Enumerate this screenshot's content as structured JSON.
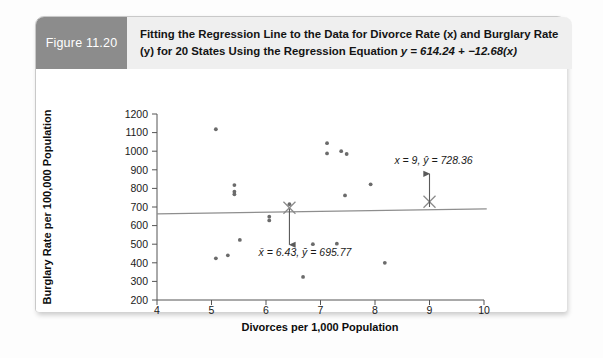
{
  "figure": {
    "badge_label": "Figure 11.20",
    "caption_line1": "Fitting the Regression Line to the Data for Divorce Rate (x) and Burglary Rate",
    "caption_line2_a": "(y) for 20 States Using the Regression Equation ",
    "caption_line2_eq": "y = 614.24 + −12.68(x)"
  },
  "chart_data": {
    "type": "scatter",
    "title": "",
    "xlabel": "Divorces per 1,000 Population",
    "ylabel": "Burglary Rate per 100,000 Population",
    "xlim": [
      4,
      10
    ],
    "ylim": [
      200,
      1200
    ],
    "xticks": [
      4,
      5,
      6,
      7,
      8,
      9,
      10
    ],
    "yticks": [
      200,
      300,
      400,
      500,
      600,
      700,
      800,
      900,
      1000,
      1100,
      1200
    ],
    "xtick_labels": [
      "4",
      "5",
      "6",
      "7",
      "8",
      "9",
      "10"
    ],
    "ytick_labels": [
      "200",
      "300",
      "400",
      "500",
      "600",
      "700",
      "800",
      "900",
      "1000",
      "1100",
      "1200"
    ],
    "grid": false,
    "legend": "none",
    "n_points": 20,
    "point_color": "#6b6b6b",
    "line_color": "#8e8e8e",
    "marker_color": "#8a8a8a",
    "points": [
      {
        "x": 5.08,
        "y": 1118
      },
      {
        "x": 5.42,
        "y": 818
      },
      {
        "x": 5.42,
        "y": 782
      },
      {
        "x": 5.42,
        "y": 768
      },
      {
        "x": 6.06,
        "y": 648
      },
      {
        "x": 6.06,
        "y": 628
      },
      {
        "x": 5.52,
        "y": 523
      },
      {
        "x": 5.08,
        "y": 424
      },
      {
        "x": 5.3,
        "y": 440
      },
      {
        "x": 6.43,
        "y": 715
      },
      {
        "x": 6.68,
        "y": 324
      },
      {
        "x": 6.86,
        "y": 500
      },
      {
        "x": 7.12,
        "y": 1043
      },
      {
        "x": 7.12,
        "y": 988
      },
      {
        "x": 7.38,
        "y": 1000
      },
      {
        "x": 7.48,
        "y": 985
      },
      {
        "x": 7.45,
        "y": 762
      },
      {
        "x": 7.3,
        "y": 503
      },
      {
        "x": 7.92,
        "y": 822
      },
      {
        "x": 8.18,
        "y": 400
      }
    ],
    "regression_line": {
      "equation": "y = 614.24 + −12.68(x)",
      "slope_drawn": 4.5,
      "intercept_drawn": 645,
      "x_start": 4.0,
      "x_end": 10.05,
      "y_start": 663,
      "y_end": 690
    },
    "markers": [
      {
        "name": "mean-point",
        "x": 6.43,
        "y": 695.77
      },
      {
        "name": "predicted-point",
        "x": 9.0,
        "y": 728.36
      }
    ],
    "annotations": [
      {
        "name": "mean-annotation",
        "text_x": "x̄ = 6.43,",
        "text_y": " ȳ = 695.77",
        "full": "x̄ = 6.43, ȳ = 695.77",
        "arrow_from": {
          "x": 6.43,
          "y": 690
        },
        "arrow_to": {
          "x": 6.43,
          "y": 470
        }
      },
      {
        "name": "prediction-annotation",
        "text_x": "x = 9,",
        "text_y": " ŷ = 728.36",
        "full": "x = 9, ŷ = 728.36",
        "arrow_from": {
          "x": 9.0,
          "y": 700
        },
        "arrow_to": {
          "x": 9.0,
          "y": 905
        }
      }
    ]
  }
}
